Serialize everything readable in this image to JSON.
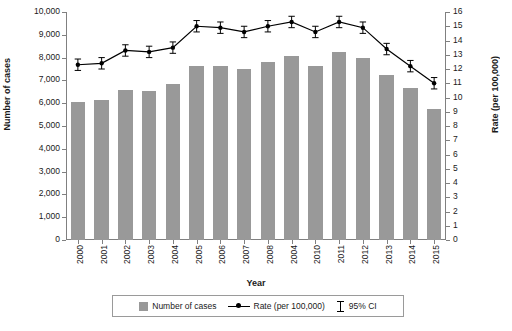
{
  "chart_data": {
    "type": "bar",
    "title": "",
    "xlabel": "Year",
    "ylabel_left": "Number of cases",
    "ylabel_right": "Rate (per 100,000)",
    "categories": [
      "2000",
      "2001",
      "2002",
      "2003",
      "2004",
      "2005",
      "2006",
      "2007",
      "2008",
      "2004",
      "2010",
      "2011",
      "2012",
      "2013",
      "2014",
      "2015"
    ],
    "ylim_left": [
      0,
      10000
    ],
    "yticks_left": [
      "0",
      "1,000",
      "2,000",
      "3,000",
      "4,000",
      "5,000",
      "6,000",
      "7,000",
      "8,000",
      "9,000",
      "10,000"
    ],
    "ylim_right": [
      0,
      16
    ],
    "yticks_right": [
      "0",
      "1",
      "2",
      "3",
      "4",
      "5",
      "6",
      "7",
      "8",
      "9",
      "10",
      "11",
      "12",
      "13",
      "14",
      "15",
      "16"
    ],
    "grid": false,
    "legend_position": "bottom",
    "series": [
      {
        "name": "Number of cases",
        "type": "bar",
        "axis": "left",
        "color": "#999999",
        "values": [
          6050,
          6150,
          6600,
          6550,
          6850,
          7650,
          7650,
          7500,
          7800,
          8050,
          7650,
          8250,
          8000,
          7250,
          6650,
          5750
        ]
      },
      {
        "name": "Rate (per 100,000)",
        "type": "line",
        "axis": "right",
        "color": "#000000",
        "values": [
          12.3,
          12.4,
          13.3,
          13.2,
          13.5,
          15.0,
          14.9,
          14.6,
          15.0,
          15.3,
          14.6,
          15.3,
          14.9,
          13.4,
          12.2,
          11.0
        ],
        "ci_low": [
          11.9,
          12.0,
          12.9,
          12.8,
          13.1,
          14.6,
          14.5,
          14.2,
          14.6,
          14.9,
          14.2,
          14.9,
          14.5,
          13.0,
          11.8,
          10.6
        ],
        "ci_high": [
          12.7,
          12.8,
          13.7,
          13.6,
          13.9,
          15.4,
          15.3,
          15.0,
          15.4,
          15.7,
          15.0,
          15.7,
          15.3,
          13.8,
          12.6,
          11.4
        ]
      }
    ],
    "legend": [
      {
        "label": "Number of cases",
        "marker": "square"
      },
      {
        "label": "Rate (per 100,000)",
        "marker": "line-point"
      },
      {
        "label": "95% CI",
        "marker": "errorbar"
      }
    ]
  }
}
